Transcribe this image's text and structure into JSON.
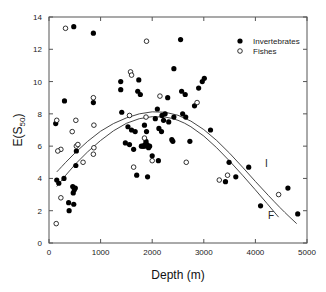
{
  "chart_data": {
    "type": "scatter",
    "title": "",
    "xlabel": "Depth (m)",
    "ylabel": "E(S50)",
    "ylabel_main": "E(S",
    "ylabel_sub": "50",
    "ylabel_close": ")",
    "xlim": [
      0,
      5000
    ],
    "ylim": [
      0,
      14
    ],
    "xticks": [
      0,
      1000,
      2000,
      3000,
      4000,
      5000
    ],
    "yticks": [
      0,
      2,
      4,
      6,
      8,
      10,
      12,
      14
    ],
    "grid": false,
    "legend_position": "upper right",
    "series": [
      {
        "name": "Invertebrates",
        "marker": "filled-circle",
        "color": "#000000",
        "points": [
          [
            480,
            13.4
          ],
          [
            860,
            13.0
          ],
          [
            2550,
            12.6
          ],
          [
            130,
            7.4
          ],
          [
            300,
            8.8
          ],
          [
            860,
            8.7
          ],
          [
            1390,
            10.0
          ],
          [
            1390,
            9.5
          ],
          [
            1740,
            10.1
          ],
          [
            1720,
            9.4
          ],
          [
            1770,
            9.2
          ],
          [
            1410,
            8.1
          ],
          [
            1530,
            7.2
          ],
          [
            1600,
            7.0
          ],
          [
            1670,
            6.9
          ],
          [
            1850,
            7.3
          ],
          [
            1890,
            6.9
          ],
          [
            1480,
            6.2
          ],
          [
            1560,
            6.1
          ],
          [
            1790,
            6.0
          ],
          [
            1820,
            6.0
          ],
          [
            1860,
            6.1
          ],
          [
            1880,
            6.3
          ],
          [
            1900,
            6.1
          ],
          [
            1640,
            5.8
          ],
          [
            1850,
            6.0
          ],
          [
            1930,
            5.9
          ],
          [
            1950,
            6.0
          ],
          [
            1700,
            4.2
          ],
          [
            1910,
            4.1
          ],
          [
            2120,
            5.1
          ],
          [
            150,
            3.9
          ],
          [
            190,
            3.7
          ],
          [
            290,
            4.0
          ],
          [
            460,
            3.5
          ],
          [
            490,
            3.3
          ],
          [
            510,
            3.4
          ],
          [
            470,
            3.1
          ],
          [
            380,
            2.5
          ],
          [
            480,
            2.4
          ],
          [
            390,
            2.0
          ],
          [
            530,
            5.7
          ],
          [
            520,
            4.8
          ],
          [
            2100,
            8.3
          ],
          [
            2250,
            8.0
          ],
          [
            2320,
            7.5
          ],
          [
            2420,
            7.8
          ],
          [
            2300,
            9.0
          ],
          [
            2570,
            9.4
          ],
          [
            2640,
            9.2
          ],
          [
            2820,
            8.5
          ],
          [
            2970,
            10.0
          ],
          [
            3010,
            10.2
          ],
          [
            2900,
            9.6
          ],
          [
            2420,
            10.8
          ],
          [
            2590,
            8.0
          ],
          [
            2650,
            7.8
          ],
          [
            2190,
            7.9
          ],
          [
            2220,
            7.6
          ],
          [
            2060,
            7.7
          ],
          [
            2130,
            7.1
          ],
          [
            2380,
            6.4
          ],
          [
            2400,
            6.3
          ],
          [
            3130,
            7.0
          ],
          [
            2180,
            6.9
          ],
          [
            2000,
            5.4
          ],
          [
            2730,
            6.3
          ],
          [
            3490,
            5.0
          ],
          [
            3620,
            4.1
          ],
          [
            3870,
            4.7
          ],
          [
            3420,
            3.8
          ],
          [
            4630,
            3.4
          ],
          [
            4100,
            2.3
          ],
          [
            4820,
            1.8
          ]
        ]
      },
      {
        "name": "Fishes",
        "marker": "open-circle",
        "color": "#000000",
        "points": [
          [
            320,
            13.3
          ],
          [
            1890,
            12.5
          ],
          [
            860,
            9.0
          ],
          [
            2870,
            8.7
          ],
          [
            150,
            7.6
          ],
          [
            520,
            7.6
          ],
          [
            870,
            7.3
          ],
          [
            1880,
            7.8
          ],
          [
            1850,
            6.5
          ],
          [
            450,
            6.9
          ],
          [
            230,
            5.8
          ],
          [
            170,
            5.7
          ],
          [
            530,
            6.0
          ],
          [
            560,
            6.1
          ],
          [
            870,
            5.9
          ],
          [
            860,
            5.5
          ],
          [
            660,
            5.0
          ],
          [
            1640,
            4.7
          ],
          [
            230,
            2.8
          ],
          [
            140,
            1.2
          ],
          [
            1580,
            10.6
          ],
          [
            1600,
            10.4
          ],
          [
            2150,
            9.1
          ],
          [
            1560,
            7.9
          ],
          [
            2660,
            5.0
          ],
          [
            3460,
            4.2
          ],
          [
            3300,
            3.9
          ],
          [
            4450,
            3.0
          ],
          [
            2000,
            5.1
          ]
        ]
      }
    ],
    "fit_curves": [
      {
        "name": "I",
        "label": "I",
        "type": "quadratic",
        "points": [
          [
            150,
            4.4
          ],
          [
            500,
            5.6
          ],
          [
            1000,
            7.0
          ],
          [
            1500,
            7.8
          ],
          [
            2000,
            8.2
          ],
          [
            2500,
            8.0
          ],
          [
            3000,
            7.1
          ],
          [
            3500,
            5.6
          ],
          [
            4000,
            3.8
          ],
          [
            4500,
            2.1
          ],
          [
            4800,
            1.2
          ]
        ]
      },
      {
        "name": "F",
        "label": "F",
        "type": "quadratic",
        "points": [
          [
            150,
            3.5
          ],
          [
            500,
            4.9
          ],
          [
            1000,
            6.4
          ],
          [
            1500,
            7.5
          ],
          [
            2000,
            7.9
          ],
          [
            2500,
            7.7
          ],
          [
            3000,
            6.7
          ],
          [
            3500,
            5.1
          ],
          [
            4000,
            3.3
          ],
          [
            4450,
            1.6
          ]
        ]
      }
    ],
    "legend": [
      {
        "label": "Invertebrates",
        "marker": "filled-circle"
      },
      {
        "label": "Fishes",
        "marker": "open-circle"
      }
    ]
  }
}
